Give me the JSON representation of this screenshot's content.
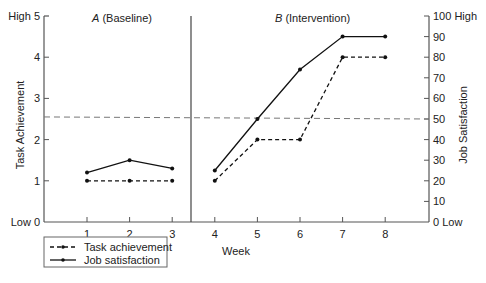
{
  "chart_data": {
    "type": "line",
    "title": "",
    "phases": [
      {
        "label_letter": "A",
        "label_text": " (Baseline)",
        "weeks": [
          1,
          2,
          3
        ]
      },
      {
        "label_letter": "B",
        "label_text": " (Intervention)",
        "weeks": [
          4,
          5,
          6,
          7,
          8
        ]
      }
    ],
    "x": [
      1,
      2,
      3,
      4,
      5,
      6,
      7,
      8
    ],
    "xlabel": "Week",
    "ylabel_left": "Task Achievement",
    "ylabel_right": "Job Satisfaction",
    "ylim_left": [
      0,
      5
    ],
    "ylim_right": [
      0,
      100
    ],
    "left_ticks": [
      "Low 0",
      "1",
      "2",
      "3",
      "4",
      "High 5"
    ],
    "right_ticks": [
      "0 Low",
      "10",
      "20",
      "30",
      "40",
      "50",
      "60",
      "70",
      "80",
      "90",
      "100 High"
    ],
    "series": [
      {
        "name": "Task achievement",
        "axis": "left",
        "style": "dashed",
        "values": [
          1,
          1,
          1,
          1,
          2,
          2,
          4,
          4
        ]
      },
      {
        "name": "Job satisfaction",
        "axis": "right",
        "style": "solid",
        "values": [
          24,
          30,
          26,
          25,
          50,
          74,
          90,
          90
        ]
      }
    ],
    "reference_line": {
      "style": "dashed",
      "left_value": 2.55,
      "right_value": 50
    },
    "legend_position": "bottom-left",
    "grid": false
  }
}
